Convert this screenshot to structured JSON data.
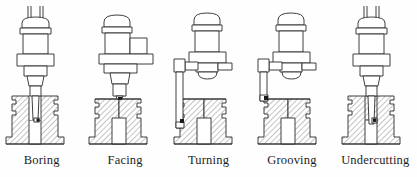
{
  "figure": {
    "line_color": "#2b2b2b",
    "hatch_color": "#8a8a8a",
    "fill_color": "#ffffff",
    "background": "#fefefe",
    "insert_color": "#1a1a1a",
    "panel_count": 5
  },
  "panels": [
    {
      "id": "boring",
      "label": "Boring",
      "tool_type": "vertical-boring-bar",
      "spindle_offset": "centered",
      "tool_position": "inside-bore",
      "has_top_rods": true,
      "arm": "none"
    },
    {
      "id": "facing",
      "label": "Facing",
      "tool_type": "facing-tool",
      "spindle_offset": "left",
      "tool_position": "top-face",
      "has_top_rods": false,
      "arm": "none"
    },
    {
      "id": "turning",
      "label": "Turning",
      "tool_type": "long-turning-bar",
      "spindle_offset": "right",
      "tool_position": "outer-left-wall",
      "has_top_rods": false,
      "arm": "long-left"
    },
    {
      "id": "grooving",
      "label": "Grooving",
      "tool_type": "grooving-bar",
      "spindle_offset": "right",
      "tool_position": "outer-left-groove",
      "has_top_rods": false,
      "arm": "short-left"
    },
    {
      "id": "undercutting",
      "label": "Undercutting",
      "tool_type": "undercutting-bar",
      "spindle_offset": "centered",
      "tool_position": "bore-bottom-right",
      "has_top_rods": true,
      "arm": "none"
    }
  ]
}
